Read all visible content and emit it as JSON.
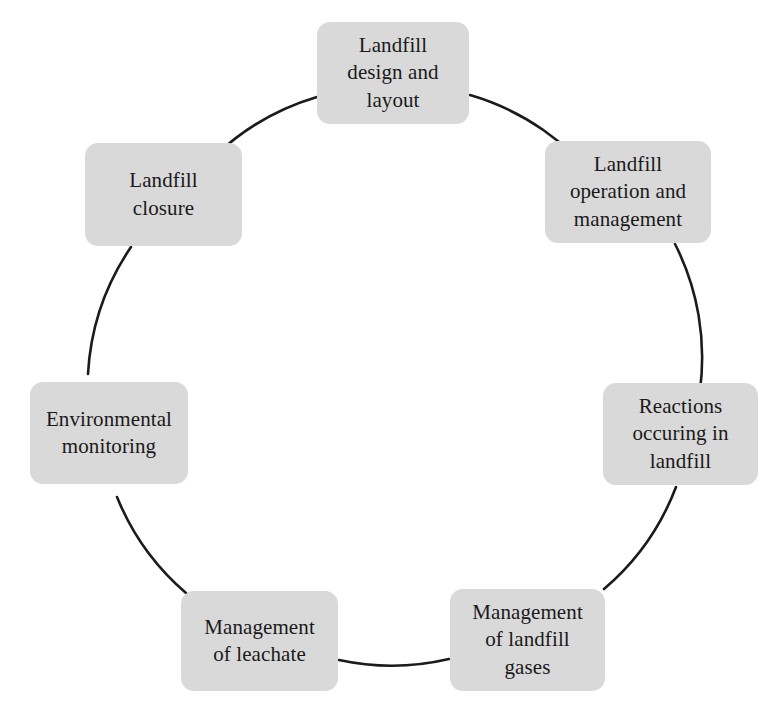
{
  "diagram": {
    "type": "cycle",
    "title": "",
    "shape": "circular process cycle with eight stages",
    "node_fill_color": "#d9d9d9",
    "arc_color": "#1b1b1b",
    "text_color": "#1a1a1a",
    "background_color": "#ffffff",
    "cycle_center": {
      "x": 387,
      "y": 396
    },
    "cycle_radius": 250,
    "nodes": [
      {
        "id": "landfill-design-and-layout",
        "label": "Landfill\ndesign and\nlayout",
        "angle_deg": 0,
        "x": 317,
        "y": 22,
        "w": 152,
        "h": 102,
        "font_size": 21
      },
      {
        "id": "landfill-operation-and-management",
        "label": "Landfill\noperation and\nmanagement",
        "angle_deg": 45,
        "x": 545,
        "y": 141,
        "w": 166,
        "h": 102,
        "font_size": 21
      },
      {
        "id": "reactions-occuring-in-landfill",
        "label": "Reactions\noccuring in\nlandfill",
        "angle_deg": 90,
        "x": 603,
        "y": 383,
        "w": 155,
        "h": 102,
        "font_size": 21
      },
      {
        "id": "management-of-landfill-gases",
        "label": "Management\nof landfill\ngases",
        "angle_deg": 135,
        "x": 450,
        "y": 589,
        "w": 155,
        "h": 102,
        "font_size": 21
      },
      {
        "id": "management-of-leachate",
        "label": "Management\nof leachate",
        "angle_deg": 180,
        "x": 181,
        "y": 591,
        "w": 157,
        "h": 100,
        "font_size": 21
      },
      {
        "id": "environmental-monitoring",
        "label": "Environmental\nmonitoring",
        "angle_deg": 225,
        "x": 30,
        "y": 382,
        "w": 158,
        "h": 102,
        "font_size": 21
      },
      {
        "id": "landfill-closure",
        "label": "Landfill\nclosure",
        "angle_deg": 270,
        "x": 85,
        "y": 143,
        "w": 157,
        "h": 103,
        "font_size": 21
      }
    ],
    "connectors": [
      {
        "from": "landfill-design-and-layout",
        "to": "landfill-operation-and-management"
      },
      {
        "from": "landfill-operation-and-management",
        "to": "reactions-occuring-in-landfill"
      },
      {
        "from": "reactions-occuring-in-landfill",
        "to": "management-of-landfill-gases"
      },
      {
        "from": "management-of-landfill-gases",
        "to": "management-of-leachate"
      },
      {
        "from": "management-of-leachate",
        "to": "environmental-monitoring"
      },
      {
        "from": "environmental-monitoring",
        "to": "landfill-closure"
      },
      {
        "from": "landfill-closure",
        "to": "landfill-design-and-layout"
      }
    ],
    "labels": {
      "design": "Landfill\ndesign and\nlayout",
      "operation": "Landfill\noperation and\nmanagement",
      "reactions": "Reactions\noccuring in\nlandfill",
      "gases": "Management\nof landfill\ngases",
      "leachate": "Management\nof leachate",
      "monitoring": "Environmental\nmonitoring",
      "closure": "Landfill\nclosure"
    }
  }
}
